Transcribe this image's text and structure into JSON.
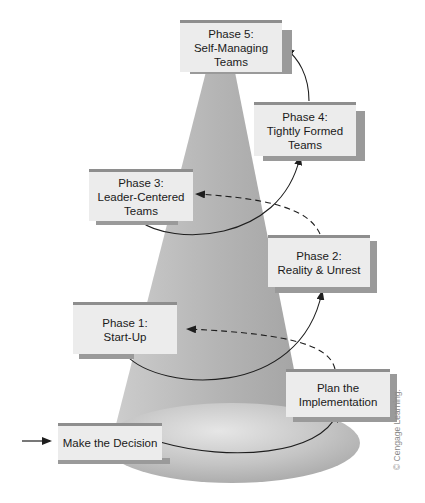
{
  "diagram": {
    "stages": [
      {
        "id": "decision",
        "label": "Make the Decision"
      },
      {
        "id": "plan",
        "label_line1": "Plan the",
        "label_line2": "Implementation"
      },
      {
        "id": "phase1",
        "label_line1": "Phase 1:",
        "label_line2": "Start-Up"
      },
      {
        "id": "phase2",
        "label_line1": "Phase 2:",
        "label_line2": "Reality & Unrest"
      },
      {
        "id": "phase3",
        "label_line1": "Phase 3:",
        "label_line2": "Leader-Centered",
        "label_line3": "Teams"
      },
      {
        "id": "phase4",
        "label_line1": "Phase 4:",
        "label_line2": "Tightly Formed",
        "label_line3": "Teams"
      },
      {
        "id": "phase5",
        "label_line1": "Phase 5:",
        "label_line2": "Self-Managing",
        "label_line3": "Teams"
      }
    ],
    "flows": [
      {
        "from": "entry",
        "to": "decision",
        "style": "solid"
      },
      {
        "from": "decision",
        "to": "plan",
        "style": "solid"
      },
      {
        "from": "plan",
        "to": "phase1",
        "style": "dashed"
      },
      {
        "from": "phase1",
        "to": "phase2",
        "style": "solid"
      },
      {
        "from": "phase2",
        "to": "phase3",
        "style": "dashed"
      },
      {
        "from": "phase3",
        "to": "phase4",
        "style": "solid"
      },
      {
        "from": "phase4",
        "to": "phase5",
        "style": "solid"
      }
    ],
    "colors": {
      "box_fill": "#ececec",
      "box_top_border": "#8e8e8e",
      "box_shadow": "#9a9a9a",
      "cone_fill": "#b8b8b8",
      "base_ellipse": "#c6c6c6",
      "arrow": "#222222"
    }
  },
  "watermark": "© Cengage Learning."
}
